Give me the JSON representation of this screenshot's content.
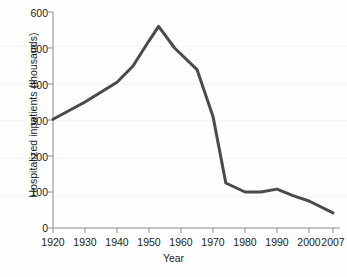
{
  "chart_data": {
    "type": "line",
    "title": "",
    "xlabel": "Year",
    "ylabel": "Hospitalized inpatients (thousands)",
    "xlim": [
      1920,
      2007
    ],
    "ylim": [
      0,
      600
    ],
    "grid": false,
    "legend": "none",
    "line_color": "#4a4a4a",
    "x_tick_labels": [
      "1920",
      "1930",
      "1940",
      "1950",
      "1960",
      "1970",
      "1980",
      "1990",
      "2000",
      "2007"
    ],
    "x_ticks": [
      1920,
      1930,
      1940,
      1950,
      1960,
      1970,
      1980,
      1990,
      2000,
      2007
    ],
    "y_tick_labels": [
      "0",
      "100",
      "200",
      "300",
      "400",
      "500",
      "600"
    ],
    "y_ticks": [
      0,
      100,
      200,
      300,
      400,
      500,
      600
    ],
    "series": [
      {
        "name": "Hospitalized inpatients",
        "x": [
          1920,
          1930,
          1940,
          1945,
          1950,
          1953,
          1958,
          1965,
          1970,
          1974,
          1980,
          1985,
          1990,
          1995,
          2000,
          2007
        ],
        "values": [
          302,
          350,
          405,
          450,
          520,
          560,
          500,
          440,
          310,
          125,
          100,
          100,
          108,
          90,
          75,
          42
        ]
      }
    ]
  }
}
